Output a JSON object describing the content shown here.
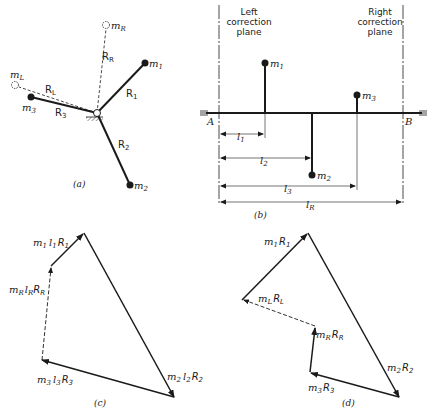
{
  "figure_a": {
    "caption": "(a)",
    "labels": {
      "m1": "m",
      "m1_sub": "1",
      "m2": "m",
      "m2_sub": "2",
      "m3": "m",
      "m3_sub": "3",
      "mL": "m",
      "mL_sub": "L",
      "mR": "m",
      "mR_sub": "R",
      "R1": "R",
      "R1_sub": "1",
      "R2": "R",
      "R2_sub": "2",
      "R3": "R",
      "R3_sub": "3",
      "RL": "R",
      "RL_sub": "L",
      "RR": "R",
      "RR_sub": "R"
    }
  },
  "figure_b": {
    "caption": "(b)",
    "left_plane": [
      "Left",
      "correction",
      "plane"
    ],
    "right_plane": [
      "Right",
      "correction",
      "plane"
    ],
    "end_A": "A",
    "end_B": "B",
    "labels": {
      "m1": "m",
      "m1_sub": "1",
      "m2": "m",
      "m2_sub": "2",
      "m3": "m",
      "m3_sub": "3",
      "l1": "l",
      "l1_sub": "1",
      "l2": "l",
      "l2_sub": "2",
      "l3": "l",
      "l3_sub": "3",
      "lR": "l",
      "lR_sub": "R"
    }
  },
  "figure_c": {
    "caption": "(c)",
    "labels": {
      "v1": [
        "m",
        "1",
        "l",
        "1",
        "R",
        "1"
      ],
      "vR": [
        "m",
        "R",
        "l",
        "R",
        "R",
        "R"
      ],
      "v3": [
        "m",
        "3",
        "l",
        "3",
        "R",
        "3"
      ],
      "v2": [
        "m",
        "2",
        "l",
        "2",
        "R",
        "2"
      ]
    }
  },
  "figure_d": {
    "caption": "(d)",
    "labels": {
      "v1": [
        "m",
        "1",
        "R",
        "1"
      ],
      "vL": [
        "m",
        "L",
        "R",
        "L"
      ],
      "vR": [
        "m",
        "R",
        "R",
        "R"
      ],
      "v3": [
        "m",
        "3",
        "R",
        "3"
      ],
      "v2": [
        "m",
        "2",
        "R",
        "2"
      ]
    }
  }
}
